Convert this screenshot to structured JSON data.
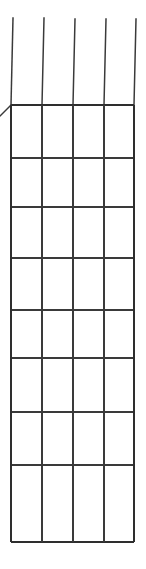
{
  "diagram": {
    "kind": "empty-perspective-table-grid",
    "background_color": "#ffffff",
    "line_color": "#3a3a3a",
    "outer_line_color": "#2e2e2e",
    "line_width": 1.6,
    "columns": 4,
    "rows": 8,
    "grid_bounds": {
      "left": 11,
      "right": 134,
      "top": 105,
      "bottom": 542
    },
    "vertical_line_x": [
      11,
      42,
      73,
      104,
      134
    ],
    "horizontal_line_y": [
      105,
      158,
      207,
      258,
      310,
      358,
      412,
      465,
      542
    ],
    "perspective_lines": [
      {
        "x1": 11,
        "y1": 105,
        "x2": 0,
        "y2": 116
      },
      {
        "x1": 11,
        "y1": 105,
        "x2": 13,
        "y2": 18
      },
      {
        "x1": 42,
        "y1": 105,
        "x2": 44,
        "y2": 18
      },
      {
        "x1": 73,
        "y1": 105,
        "x2": 75,
        "y2": 19
      },
      {
        "x1": 104,
        "y1": 105,
        "x2": 106,
        "y2": 19
      },
      {
        "x1": 134,
        "y1": 105,
        "x2": 136,
        "y2": 19
      }
    ],
    "cells": [
      [
        "",
        "",
        "",
        ""
      ],
      [
        "",
        "",
        "",
        ""
      ],
      [
        "",
        "",
        "",
        ""
      ],
      [
        "",
        "",
        "",
        ""
      ],
      [
        "",
        "",
        "",
        ""
      ],
      [
        "",
        "",
        "",
        ""
      ],
      [
        "",
        "",
        "",
        ""
      ],
      [
        "",
        "",
        "",
        ""
      ]
    ]
  }
}
